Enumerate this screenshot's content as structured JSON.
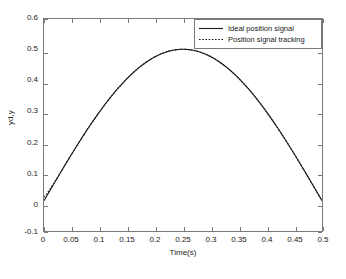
{
  "chart_data": {
    "type": "line",
    "title": "",
    "xlabel": "Time(s)",
    "ylabel": "yd,y",
    "xlim": [
      0,
      0.5
    ],
    "ylim": [
      -0.1,
      0.6
    ],
    "xticks": [
      "0",
      "0.05",
      "0.1",
      "0.15",
      "0.2",
      "0.25",
      "0.3",
      "0.35",
      "0.4",
      "0.45",
      "0.5"
    ],
    "xtick_values": [
      0,
      0.05,
      0.1,
      0.15,
      0.2,
      0.25,
      0.3,
      0.35,
      0.4,
      0.45,
      0.5
    ],
    "yticks": [
      "-0.1",
      "0",
      "0.1",
      "0.2",
      "0.3",
      "0.4",
      "0.5",
      "0.6"
    ],
    "ytick_values": [
      -0.1,
      0,
      0.1,
      0.2,
      0.3,
      0.4,
      0.5,
      0.6
    ],
    "grid": false,
    "legend_position": "top-right",
    "x": [
      0,
      0.0125,
      0.025,
      0.0375,
      0.05,
      0.0625,
      0.075,
      0.0875,
      0.1,
      0.1125,
      0.125,
      0.1375,
      0.15,
      0.1625,
      0.175,
      0.1875,
      0.2,
      0.2125,
      0.225,
      0.2375,
      0.25,
      0.2625,
      0.275,
      0.2875,
      0.3,
      0.3125,
      0.325,
      0.3375,
      0.35,
      0.3625,
      0.375,
      0.3875,
      0.4,
      0.4125,
      0.425,
      0.4375,
      0.45,
      0.4625,
      0.475,
      0.4875,
      0.5
    ],
    "series": [
      {
        "name": "Ideal position signal",
        "style": "solid",
        "color": "#1a1a1a",
        "values": [
          0,
          0.0392,
          0.0772,
          0.1137,
          0.1469,
          0.1768,
          0.2034,
          0.2269,
          0.2472,
          0.2642,
          0.2778,
          0.2881,
          0.2951,
          0.2988,
          0.2992,
          0.4619,
          0.4755,
          0.4904,
          0.4981,
          0.5,
          0.4981,
          0.4904,
          0.4755,
          0.4619,
          0.433,
          0.3928,
          0.3536,
          0.309,
          0.25,
          0.1913,
          0.1464,
          0.0975,
          0.0476,
          0.0245,
          0.0123,
          0.0062,
          0.0031,
          0.0015,
          0.0008,
          0.0004,
          0
        ]
      },
      {
        "name": "Position signal tracking",
        "style": "dotted",
        "color": "#1a1a1a",
        "values": [
          0.005,
          0.042,
          0.0792,
          0.115,
          0.148,
          0.1775,
          0.204,
          0.2272,
          0.2474,
          0.2643,
          0.2779,
          0.2882,
          0.2952,
          0.2989,
          0.2993,
          0.462,
          0.4756,
          0.4905,
          0.4982,
          0.5,
          0.4981,
          0.4904,
          0.4755,
          0.4619,
          0.433,
          0.3928,
          0.3536,
          0.309,
          0.25,
          0.1913,
          0.1464,
          0.0975,
          0.0476,
          0.0245,
          0.0123,
          0.0062,
          0.0031,
          0.0015,
          0.0008,
          0.0004,
          0
        ]
      }
    ],
    "curve_formula": "0.5*sin(2*pi*t)"
  },
  "legend": {
    "items": [
      {
        "label": "Ideal position signal",
        "style": "solid"
      },
      {
        "label": "Position signal tracking",
        "style": "dotted"
      }
    ]
  },
  "colors": {
    "axis": "#7a7a7a",
    "curve": "#1a1a1a",
    "background": "#ffffff",
    "text": "#1a1a1a"
  }
}
